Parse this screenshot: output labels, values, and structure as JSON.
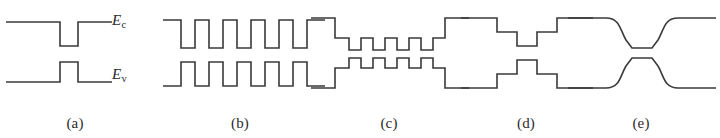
{
  "figure": {
    "width": 720,
    "height": 138,
    "background": "#ffffff",
    "stroke_color": "#3a3a3a",
    "stroke_width": 1.6
  },
  "band_labels": {
    "conduction": {
      "symbol": "E",
      "subscript": "c",
      "text": "Ec"
    },
    "valence": {
      "symbol": "E",
      "subscript": "v",
      "text": "Ev"
    }
  },
  "panels": [
    {
      "id": "a",
      "caption": "(a)",
      "name": "single-quantum-well",
      "wells": 1,
      "ec_path": "M 6 22 L 60 22 L 60 46 L 78 46 L 78 22 L 112 22",
      "ev_path": "M 6 82 L 60 82 L 60 62 L 78 62 L 78 82 L 112 82"
    },
    {
      "id": "b",
      "caption": "(b)",
      "name": "multiple-quantum-well",
      "wells": 5,
      "ec_path": "M 8 20 L 26 20 L 26 48 L 40 48 L 40 20 L 54 20 L 54 48 L 68 48 L 68 20 L 82 20 L 82 48 L 96 48 L 96 20 L 110 20 L 110 48 L 124 48 L 124 20 L 138 20 L 138 48 L 152 48 L 152 20 L 170 20",
      "ev_path": "M 8 86 L 26 86 L 26 62 L 40 62 L 40 86 L 54 86 L 54 62 L 68 62 L 68 86 L 82 86 L 82 62 L 96 62 L 96 86 L 110 86 L 110 62 L 124 62 L 124 86 L 138 86 L 138 62 L 152 62 L 152 86 L 170 86"
    },
    {
      "id": "c",
      "caption": "(c)",
      "name": "separate-confinement-multiple-quantum-well",
      "wells": 5,
      "ec_path": "M 6 18 L 30 18 L 30 38 L 44 38 L 44 50 L 56 50 L 56 38 L 68 38 L 68 50 L 80 50 L 80 38 L 92 38 L 92 50 L 104 50 L 104 38 L 116 38 L 116 50 L 128 50 L 128 38 L 140 38 L 140 18 L 164 18",
      "ev_path": "M 6 88 L 30 88 L 30 68 L 44 68 L 44 58 L 56 58 L 56 68 L 68 68 L 68 58 L 80 58 L 80 68 L 92 68 L 92 58 L 104 58 L 104 68 L 116 68 L 116 58 L 128 58 L 128 68 L 140 68 L 140 88 L 164 88"
    },
    {
      "id": "d",
      "caption": "(d)",
      "name": "stepped-graded-index-well",
      "wells": 1,
      "ec_path": "M 6 18 L 42 18 L 42 32 L 62 32 L 62 46 L 82 46 L 82 32 L 102 32 L 102 18 L 138 18",
      "ev_path": "M 6 88 L 42 88 L 42 74 L 62 74 L 62 60 L 82 60 L 82 74 L 102 74 L 102 88 L 138 88"
    },
    {
      "id": "e",
      "caption": "(e)",
      "name": "continuously-graded-index-well",
      "wells": 1,
      "ec_path": "M 6 18 L 44 18 C 58 18 58 30 64 40 L 70 48 L 90 48 L 96 40 C 102 30 102 18 116 18 L 154 18",
      "ev_path": "M 6 88 L 44 88 C 58 88 58 76 64 66 L 70 58 L 90 58 L 96 66 C 102 76 102 88 116 88 L 154 88"
    }
  ]
}
